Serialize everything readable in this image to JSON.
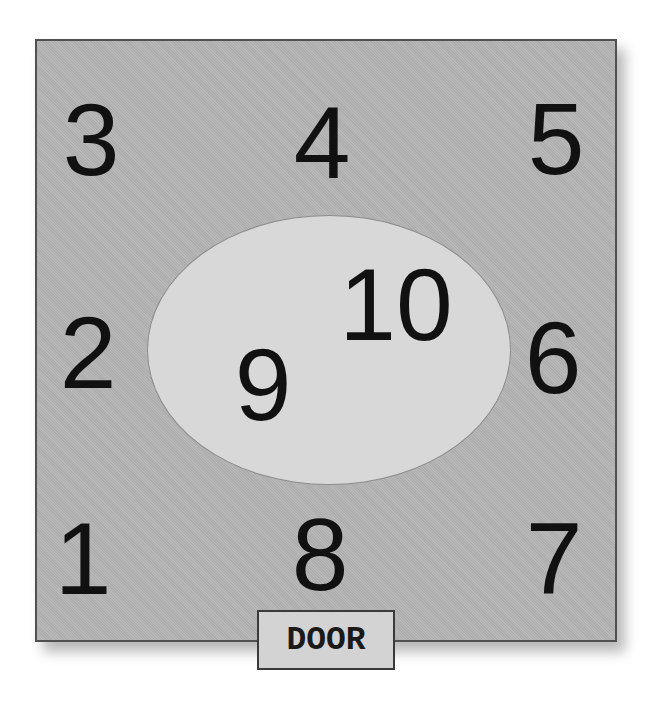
{
  "diagram": {
    "title": "",
    "room_color": "#b4b4b4",
    "center_area_color": "#d8d8d8",
    "positions": {
      "p1": "1",
      "p2": "2",
      "p3": "3",
      "p4": "4",
      "p5": "5",
      "p6": "6",
      "p7": "7",
      "p8": "8",
      "p9": "9",
      "p10": "10"
    },
    "door_label": "DOOR"
  }
}
